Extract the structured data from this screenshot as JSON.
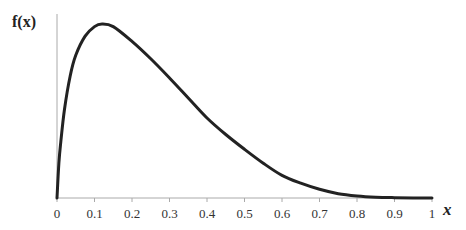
{
  "chart_data": {
    "type": "line",
    "title": "",
    "xlabel": "x",
    "ylabel": "f(x)",
    "xlim": [
      0,
      1
    ],
    "ylim": [
      0,
      1.05
    ],
    "grid": false,
    "legend": null,
    "x_ticks": [
      "0",
      "0.1",
      "0.2",
      "0.3",
      "0.4",
      "0.5",
      "0.6",
      "0.7",
      "0.8",
      "0.9",
      "1"
    ],
    "y_ticks": [],
    "series": [
      {
        "name": "f(x)",
        "color": "#222222",
        "x": [
          0,
          0.005,
          0.01,
          0.02,
          0.035,
          0.05,
          0.075,
          0.1,
          0.12,
          0.15,
          0.2,
          0.25,
          0.3,
          0.35,
          0.4,
          0.45,
          0.5,
          0.55,
          0.6,
          0.65,
          0.7,
          0.75,
          0.8,
          0.85,
          0.9,
          0.95,
          1.0
        ],
        "y": [
          0,
          0.2,
          0.32,
          0.51,
          0.7,
          0.82,
          0.93,
          0.985,
          1.0,
          0.985,
          0.9,
          0.8,
          0.69,
          0.575,
          0.46,
          0.365,
          0.28,
          0.2,
          0.13,
          0.085,
          0.05,
          0.025,
          0.012,
          0.005,
          0.002,
          0.0005,
          0
        ]
      }
    ]
  }
}
